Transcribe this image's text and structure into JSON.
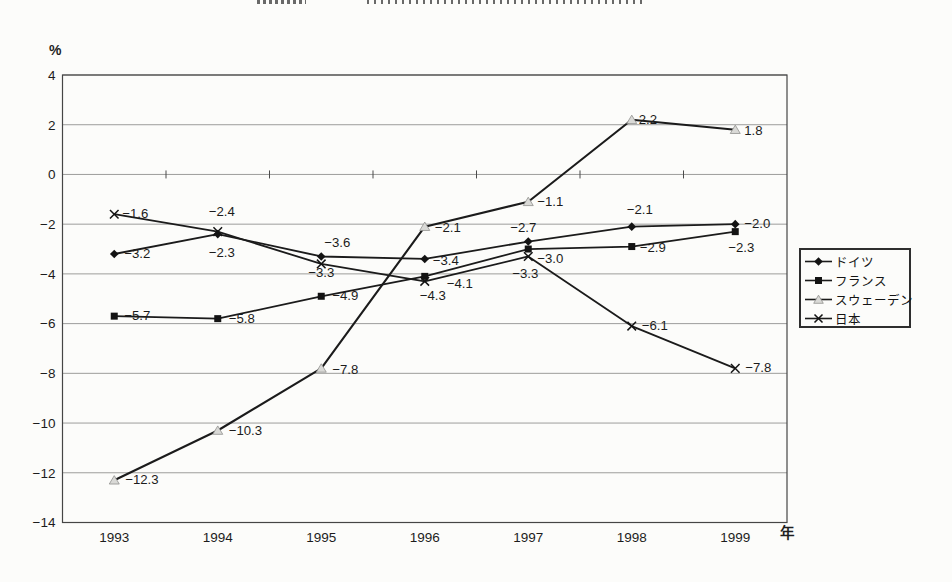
{
  "axes": {
    "y": {
      "unit": "%",
      "ticks": [
        4,
        2,
        0,
        -2,
        -4,
        -6,
        -8,
        -10,
        -12,
        -14
      ],
      "tick_labels": [
        "4",
        "2",
        "0",
        "−2",
        "−4",
        "−6",
        "−8",
        "−10",
        "−12",
        "−14"
      ],
      "min": -14,
      "max": 4
    },
    "x": {
      "unit": "年",
      "categories": [
        "1993",
        "1994",
        "1995",
        "1996",
        "1997",
        "1998",
        "1999"
      ]
    }
  },
  "legend": {
    "items": [
      {
        "id": "germany",
        "label": "ドイツ",
        "marker": "diamond"
      },
      {
        "id": "france",
        "label": "フランス",
        "marker": "square"
      },
      {
        "id": "sweden",
        "label": "スウェーデン",
        "marker": "triangle"
      },
      {
        "id": "japan",
        "label": "日本",
        "marker": "x"
      }
    ]
  },
  "chart_data": {
    "type": "line",
    "x": [
      1993,
      1994,
      1995,
      1996,
      1997,
      1998,
      1999
    ],
    "xlabel": "年",
    "ylabel": "%",
    "ylim": [
      -14,
      4
    ],
    "grid": true,
    "legend_position": "right",
    "series": [
      {
        "id": "germany",
        "name": "ドイツ",
        "marker": "diamond",
        "color": "#1b1b1b",
        "values": [
          -3.2,
          -2.4,
          -3.3,
          -3.4,
          -2.7,
          -2.1,
          -2.0
        ],
        "labels": [
          {
            "t": "−3.2",
            "dx": 10,
            "dy": 4
          },
          {
            "t": "−2.4",
            "dx": 4,
            "dy": -18,
            "a": "middle"
          },
          {
            "t": "−3.3",
            "dx": 0,
            "dy": 21,
            "a": "middle"
          },
          {
            "t": "−3.4",
            "dx": 8,
            "dy": 6
          },
          {
            "t": "−2.7",
            "dx": -5,
            "dy": -10,
            "a": "middle"
          },
          {
            "t": "−2.1",
            "dx": 8,
            "dy": -13,
            "a": "middle"
          },
          {
            "t": "−2.0",
            "dx": 9,
            "dy": 4
          }
        ]
      },
      {
        "id": "france",
        "name": "フランス",
        "marker": "square",
        "color": "#1b1b1b",
        "values": [
          -5.7,
          -5.8,
          -4.9,
          -4.1,
          -3.0,
          -2.9,
          -2.3
        ],
        "labels": [
          {
            "t": "−5.7",
            "dx": 10,
            "dy": 4
          },
          {
            "t": "−5.8",
            "dx": 11,
            "dy": 4
          },
          {
            "t": "−4.9",
            "dx": 11,
            "dy": 4
          },
          {
            "t": "−4.1",
            "dx": 22,
            "dy": 12
          },
          {
            "t": "−3.0",
            "dx": 9,
            "dy": 14
          },
          {
            "t": "−2.9",
            "dx": 8,
            "dy": 5
          },
          {
            "t": "−2.3",
            "dx": 6,
            "dy": 20,
            "a": "middle"
          }
        ]
      },
      {
        "id": "sweden",
        "name": "スウェーデン",
        "marker": "triangle",
        "color": "#1b1b1b",
        "values": [
          -12.3,
          -10.3,
          -7.8,
          -2.1,
          -1.1,
          2.2,
          1.8
        ],
        "labels": [
          {
            "t": "−12.3",
            "dx": 11,
            "dy": 4
          },
          {
            "t": "−10.3",
            "dx": 11,
            "dy": 4
          },
          {
            "t": "−7.8",
            "dx": 11,
            "dy": 6
          },
          {
            "t": "−2.1",
            "dx": 10,
            "dy": 5
          },
          {
            "t": "−1.1",
            "dx": 9,
            "dy": 4
          },
          {
            "t": "2.2",
            "dx": 7,
            "dy": 4
          },
          {
            "t": "1.8",
            "dx": 9,
            "dy": 5
          }
        ]
      },
      {
        "id": "japan",
        "name": "日本",
        "marker": "x",
        "color": "#1b1b1b",
        "values": [
          -1.6,
          -2.3,
          -3.6,
          -4.3,
          -3.3,
          -6.1,
          -7.8
        ],
        "labels": [
          {
            "t": "−1.6",
            "dx": 8,
            "dy": 4
          },
          {
            "t": "−2.3",
            "dx": 4,
            "dy": 25,
            "a": "middle"
          },
          {
            "t": "−3.6",
            "dx": 16,
            "dy": -17,
            "a": "middle"
          },
          {
            "t": "−4.3",
            "dx": 8,
            "dy": 19,
            "a": "middle"
          },
          {
            "t": "−3.3",
            "dx": -3,
            "dy": 22,
            "a": "middle"
          },
          {
            "t": "−6.1",
            "dx": 10,
            "dy": 4
          },
          {
            "t": "−7.8",
            "dx": 10,
            "dy": 4
          }
        ]
      }
    ]
  }
}
